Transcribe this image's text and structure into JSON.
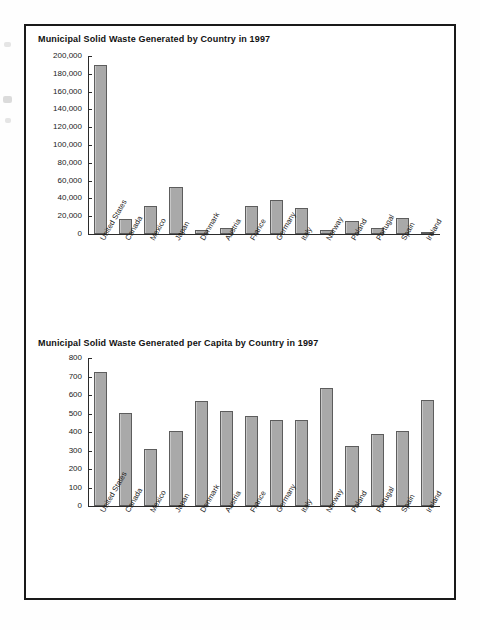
{
  "page": {
    "background_color": "#ffffff",
    "border_color": "#1a1a1a",
    "bar_fill_color": "#a9a9a9",
    "bar_edge_color": "#5d5d5d",
    "axis_color": "#2b2b2b",
    "text_color": "#1a1a1a"
  },
  "chart_data": [
    {
      "type": "bar",
      "title": "Municipal Solid Waste Generated by Country in 1997",
      "xlabel": "",
      "ylabel": "",
      "ylim": [
        0,
        200000
      ],
      "ytick_step": 20000,
      "grid": false,
      "legend": "none",
      "ytick_labels": [
        "0",
        "20,000",
        "40,000",
        "60,000",
        "80,000",
        "100,000",
        "120,000",
        "140,000",
        "160,000",
        "180,000",
        "200,000"
      ],
      "categories": [
        "United States",
        "Canada",
        "Mexico",
        "Japan",
        "Denmark",
        "Austria",
        "France",
        "Germany",
        "Italy",
        "Norway",
        "Poland",
        "Portugal",
        "Spain",
        "Ireland"
      ],
      "values": [
        190000,
        16500,
        31000,
        53000,
        4200,
        7300,
        31000,
        38500,
        29000,
        4800,
        15000,
        6200,
        17800,
        2300
      ]
    },
    {
      "type": "bar",
      "title": "Municipal Solid Waste Generated per Capita by Country in 1997",
      "xlabel": "",
      "ylabel": "",
      "ylim": [
        0,
        800
      ],
      "ytick_step": 100,
      "grid": false,
      "legend": "none",
      "ytick_labels": [
        "0",
        "100",
        "200",
        "300",
        "400",
        "500",
        "600",
        "700",
        "800"
      ],
      "categories": [
        "United States",
        "Canada",
        "Mexico",
        "Japan",
        "Denmark",
        "Austria",
        "France",
        "Germany",
        "Italy",
        "Norway",
        "Poland",
        "Portugal",
        "Spain",
        "Ireland"
      ],
      "values": [
        725,
        502,
        310,
        405,
        570,
        515,
        487,
        465,
        465,
        638,
        325,
        390,
        403,
        575
      ]
    }
  ]
}
